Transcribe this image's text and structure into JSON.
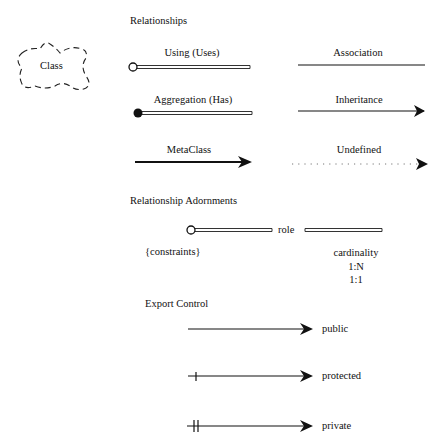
{
  "diagram": {
    "class_cloud": {
      "label": "Class"
    },
    "sections": {
      "relationships": {
        "title": "Relationships"
      },
      "adornments": {
        "title": "Relationship Adornments"
      },
      "export_control": {
        "title": "Export Control"
      }
    },
    "relationships": [
      {
        "label": "Using (Uses)",
        "style": "double-line",
        "start": "open-circle"
      },
      {
        "label": "Association",
        "style": "solid-line"
      },
      {
        "label": "Aggregation (Has)",
        "style": "double-line",
        "start": "filled-circle"
      },
      {
        "label": "Inheritance",
        "style": "solid-line",
        "end": "arrow"
      },
      {
        "label": "MetaClass",
        "style": "thick-line",
        "end": "arrow"
      },
      {
        "label": "Undefined",
        "style": "dotted-line",
        "end": "arrow"
      }
    ],
    "adornments": {
      "role": "role",
      "constraints": "{constraints}",
      "cardinality": {
        "title": "cardinality",
        "values": [
          "1:N",
          "1:1"
        ]
      }
    },
    "export_control": [
      {
        "label": "public",
        "ticks": 0
      },
      {
        "label": "protected",
        "ticks": 1
      },
      {
        "label": "private",
        "ticks": 2
      }
    ],
    "colors": {
      "line": "#111111",
      "background": "#ffffff"
    }
  }
}
